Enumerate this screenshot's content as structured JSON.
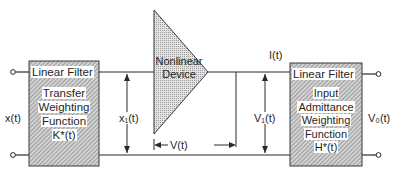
{
  "diagram": {
    "type": "block-diagram",
    "left_block": {
      "title": "Linear Filter",
      "lines": [
        "Transfer",
        "Weighting",
        "Function",
        "K*(t)"
      ]
    },
    "nonlinear_block": {
      "lines": [
        "Nonlinear",
        "Device"
      ]
    },
    "right_block": {
      "title": "Linear Filter",
      "lines": [
        "Input",
        "Admittance",
        "Weighting",
        "Function",
        "H*(t)"
      ]
    },
    "signals": {
      "input": "x(t)",
      "intermediate": "x₁(t)",
      "device_voltage": "V(t)",
      "current": "I(t)",
      "filter_input_voltage": "V₁(t)",
      "output": "V₀(t)"
    },
    "colors": {
      "line": "#2a2a2a",
      "hatch": "#8a8a8a",
      "box_fill": "#cfcfcf",
      "triangle_fill": "#dedede"
    }
  }
}
